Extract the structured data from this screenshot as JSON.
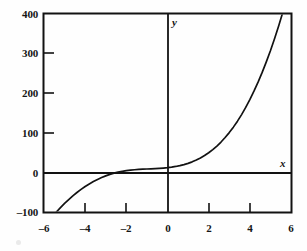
{
  "chart_data": {
    "type": "line",
    "title": "",
    "xlabel": "x",
    "ylabel": "y",
    "xlim": [
      -6,
      6
    ],
    "ylim": [
      -100,
      400
    ],
    "grid": false,
    "legend": null,
    "xticks": [
      -6,
      -4,
      -2,
      0,
      2,
      4,
      6
    ],
    "xtick_labels": [
      "–6",
      "–4",
      "–2",
      "0",
      "2",
      "4",
      "6"
    ],
    "yticks": [
      -100,
      0,
      100,
      200,
      300,
      400
    ],
    "ytick_labels": [
      "–100",
      "0",
      "100",
      "200",
      "300",
      "400"
    ],
    "series": [
      {
        "name": "curve",
        "x": [
          -5.4,
          -5.2,
          -5.0,
          -4.8,
          -4.6,
          -4.4,
          -4.2,
          -4.0,
          -3.8,
          -3.6,
          -3.4,
          -3.2,
          -3.0,
          -2.8,
          -2.6,
          -2.4,
          -2.2,
          -2.0,
          -1.8,
          -1.6,
          -1.4,
          -1.2,
          -1.0,
          -0.8,
          -0.6,
          -0.4,
          -0.2,
          0.0,
          0.2,
          0.4,
          0.6,
          0.8,
          1.0,
          1.2,
          1.4,
          1.6,
          1.8,
          2.0,
          2.2,
          2.4,
          2.6,
          2.8,
          3.0,
          3.2,
          3.4,
          3.6,
          3.8,
          4.0,
          4.2,
          4.4,
          4.6,
          4.8,
          5.0,
          5.2,
          5.4,
          5.6,
          5.8,
          6.0
        ],
        "y": [
          -100.0,
          -88.8,
          -78.3,
          -68.5,
          -59.3,
          -50.8,
          -42.9,
          -35.7,
          -29.1,
          -23.1,
          -17.7,
          -12.9,
          -8.7,
          -5.1,
          -2.0,
          0.6,
          2.7,
          4.4,
          5.7,
          6.7,
          7.5,
          8.1,
          8.6,
          9.1,
          9.6,
          10.2,
          11.0,
          12.0,
          13.3,
          15.0,
          17.1,
          19.7,
          22.9,
          26.7,
          31.2,
          36.5,
          42.6,
          49.6,
          57.6,
          66.6,
          76.7,
          88.0,
          100.5,
          114.3,
          129.4,
          146.0,
          164.1,
          183.7,
          205.0,
          227.9,
          252.5,
          279.0,
          307.3,
          337.6,
          369.8,
          404.1,
          440.5,
          479.0
        ]
      }
    ]
  },
  "figure": {
    "axis_label_x": "x",
    "axis_label_y": "y",
    "frame_color": "#121212",
    "curve_color": "#121212",
    "background_color": "#fefefe"
  }
}
